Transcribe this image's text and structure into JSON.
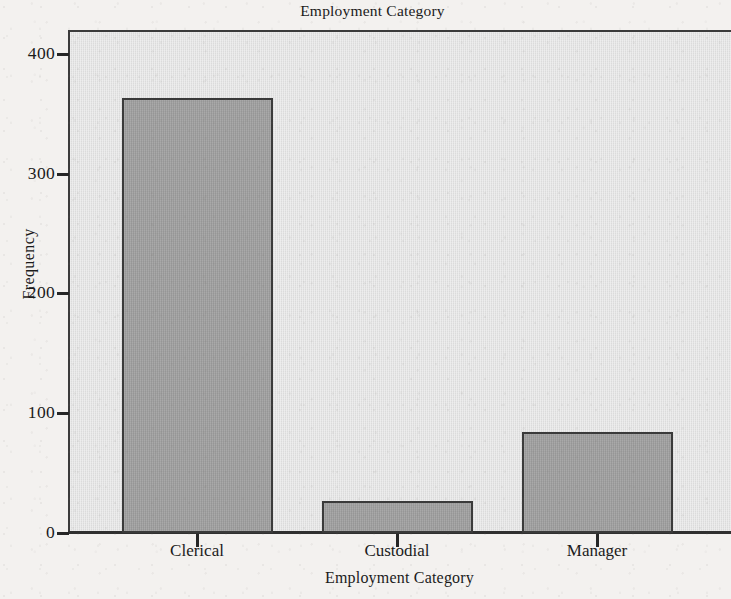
{
  "chart_data": {
    "type": "bar",
    "title": "Employment Category",
    "xlabel": "Employment Category",
    "ylabel": "Frequency",
    "categories": [
      "Clerical",
      "Custodial",
      "Manager"
    ],
    "values": [
      363,
      27,
      84
    ],
    "ylim": [
      0,
      420
    ],
    "yticks": [
      0,
      100,
      200,
      300,
      400
    ],
    "ytick_labels": [
      "0",
      "100",
      "200",
      "300",
      "400"
    ],
    "grid": false,
    "legend": "none",
    "note_cropped": "plot area extends past the right edge of the image",
    "colors": {
      "bar_fill": "#9b9b9b",
      "bar_edge": "#3a3a3a",
      "plot_background": "#e3e3e3",
      "page_background": "#f3f1ef",
      "axis": "#303030",
      "text": "#1b1b1b"
    }
  }
}
